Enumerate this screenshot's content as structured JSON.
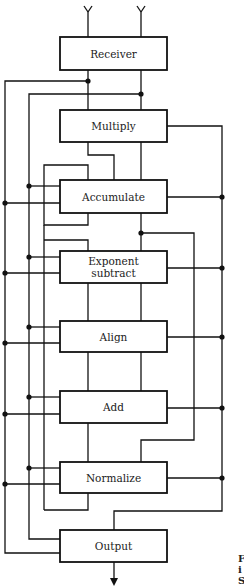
{
  "diagram": {
    "type": "block-diagram",
    "blocks": [
      {
        "id": "receiver",
        "label": "Receiver"
      },
      {
        "id": "multiply",
        "label": "Multiply"
      },
      {
        "id": "accumulate",
        "label": "Accumulate"
      },
      {
        "id": "exponent-subtract",
        "label_line1": "Exponent",
        "label_line2": "subtract"
      },
      {
        "id": "align",
        "label": "Align"
      },
      {
        "id": "add",
        "label": "Add"
      },
      {
        "id": "normalize",
        "label": "Normalize"
      },
      {
        "id": "output",
        "label": "Output"
      }
    ],
    "inputs": [
      "antenna-left",
      "antenna-right"
    ],
    "output_arrow": "down",
    "caption_fragment": [
      "F",
      "i",
      "S"
    ]
  }
}
